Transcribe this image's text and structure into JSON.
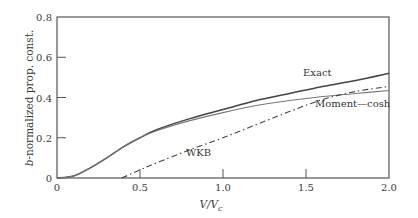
{
  "chart_data": {
    "type": "line",
    "title": "",
    "xlabel": "V/V_c",
    "ylabel": "b-normalized prop. const.",
    "xlim": [
      0,
      2.0
    ],
    "ylim": [
      0,
      0.8
    ],
    "xticks": [
      "0",
      "0.5",
      "1.0",
      "1.5",
      "2.0"
    ],
    "yticks": [
      "0",
      "0.2",
      "0.4",
      "0.6",
      "0.8"
    ],
    "grid": false,
    "legend": "inline annotations",
    "series": [
      {
        "name": "Exact",
        "style": "solid",
        "x": [
          0,
          0.1,
          0.2,
          0.3,
          0.4,
          0.5,
          0.6,
          0.8,
          1.0,
          1.2,
          1.4,
          1.6,
          1.8,
          2.0
        ],
        "y": [
          0,
          0.01,
          0.05,
          0.1,
          0.155,
          0.2,
          0.24,
          0.295,
          0.34,
          0.385,
          0.42,
          0.455,
          0.485,
          0.52
        ]
      },
      {
        "name": "Moment—cosh",
        "style": "solid-thin",
        "x": [
          0,
          0.1,
          0.2,
          0.3,
          0.4,
          0.5,
          0.6,
          0.8,
          1.0,
          1.2,
          1.4,
          1.6,
          1.8,
          2.0
        ],
        "y": [
          0,
          0.01,
          0.05,
          0.1,
          0.155,
          0.2,
          0.235,
          0.285,
          0.325,
          0.36,
          0.385,
          0.405,
          0.42,
          0.435
        ]
      },
      {
        "name": "WKB",
        "style": "dash-dot",
        "x": [
          0.39,
          0.5,
          0.6,
          0.8,
          1.0,
          1.2,
          1.4,
          1.6,
          1.8,
          2.0
        ],
        "y": [
          0,
          0.04,
          0.075,
          0.14,
          0.2,
          0.265,
          0.33,
          0.39,
          0.43,
          0.455
        ]
      }
    ],
    "annotations": [
      {
        "text": "Exact",
        "x": 1.37,
        "y": 0.47
      },
      {
        "text": "Moment—cosh",
        "x": 1.6,
        "y": 0.38
      },
      {
        "text": "WKB",
        "x": 0.93,
        "y": 0.13
      }
    ]
  },
  "labels": {
    "xlabel_main": "V/V",
    "xlabel_sub": "c",
    "ylabel_italic": "b",
    "ylabel_rest": "-normalized prop. const.",
    "ann_exact": "Exact",
    "ann_moment": "Moment—cosh",
    "ann_wkb": "WKB"
  }
}
